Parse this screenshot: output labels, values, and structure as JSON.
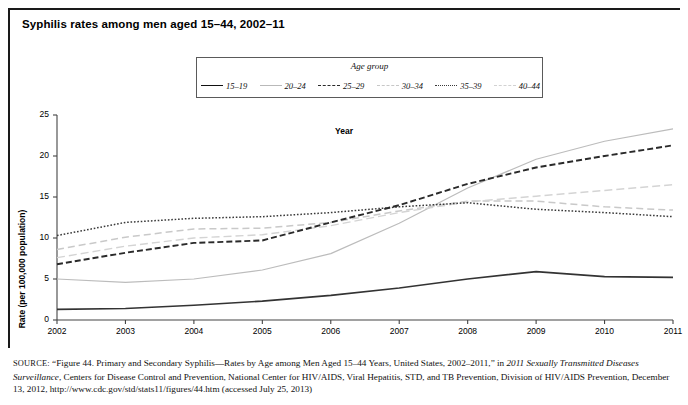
{
  "figure": {
    "title": "Syphilis rates among men aged 15–44, 2002–11"
  },
  "legend": {
    "title": "Age group",
    "items": [
      {
        "label": "15–19",
        "style": "solid-dark"
      },
      {
        "label": "20–24",
        "style": "solid-light"
      },
      {
        "label": "25–29",
        "style": "dash-dark"
      },
      {
        "label": "30–34",
        "style": "dash-light"
      },
      {
        "label": "35–39",
        "style": "dot-dark"
      },
      {
        "label": "40–44",
        "style": "dash-lighter"
      }
    ]
  },
  "axes": {
    "ylabel": "Rate (per 100,000 population)",
    "xlabel": "Year",
    "yticks": [
      "0",
      "5",
      "10",
      "15",
      "20",
      "25"
    ],
    "xticks": [
      "2002",
      "2003",
      "2004",
      "2005",
      "2006",
      "2007",
      "2008",
      "2009",
      "2010",
      "2011"
    ]
  },
  "source": {
    "label": "SOURCE:",
    "line1_a": " “Figure 44. Primary and Secondary Syphilis—Rates by Age among Men Aged 15–44 Years, United States, 2002–2011,” in ",
    "line1_em": "2011 Sexually Transmitted Diseases Surveillance",
    "line1_b": ", Centers for Disease Control and Prevention, National Center for HIV/AIDS, Viral Hepatitis, STD, and TB Prevention, Division of HIV/AIDS Prevention, December 13, 2012, http://www.cdc.gov/std/stats11/figures/44.htm (accessed July 25, 2013)"
  },
  "chart_data": {
    "type": "line",
    "title": "Syphilis rates among men aged 15–44, 2002–11",
    "xlabel": "Year",
    "ylabel": "Rate (per 100,000 population)",
    "legend_title": "Age group",
    "legend_position": "top-center",
    "grid": false,
    "x": [
      2002,
      2003,
      2004,
      2005,
      2006,
      2007,
      2008,
      2009,
      2010,
      2011
    ],
    "xlim": [
      2002,
      2011
    ],
    "ylim": [
      0,
      25
    ],
    "yticks": [
      0,
      5,
      10,
      15,
      20,
      25
    ],
    "series": [
      {
        "name": "15–19",
        "style": "solid-dark",
        "color": "#333333",
        "values": [
          1.3,
          1.4,
          1.8,
          2.3,
          3.0,
          3.9,
          5.0,
          5.9,
          5.3,
          5.2
        ]
      },
      {
        "name": "20–24",
        "style": "solid-light",
        "color": "#bcbcbc",
        "values": [
          5.0,
          4.6,
          5.0,
          6.1,
          8.1,
          11.8,
          16.1,
          19.6,
          21.8,
          23.3
        ]
      },
      {
        "name": "25–29",
        "style": "dash-dark",
        "color": "#2a2a2a",
        "values": [
          6.8,
          8.2,
          9.4,
          9.7,
          11.9,
          14.0,
          16.6,
          18.6,
          20.0,
          21.3
        ]
      },
      {
        "name": "30–34",
        "style": "dash-light",
        "color": "#c9c9c9",
        "values": [
          8.6,
          10.1,
          11.1,
          11.2,
          11.9,
          13.3,
          14.5,
          14.5,
          13.8,
          13.4
        ]
      },
      {
        "name": "35–39",
        "style": "dot-dark",
        "color": "#3a3a3a",
        "values": [
          10.3,
          11.9,
          12.4,
          12.6,
          13.1,
          13.8,
          14.3,
          13.5,
          13.1,
          12.6
        ]
      },
      {
        "name": "40–44",
        "style": "dash-lighter",
        "color": "#d4d4d4",
        "values": [
          7.6,
          9.0,
          10.0,
          10.4,
          11.5,
          13.1,
          14.4,
          15.1,
          15.8,
          16.5
        ]
      }
    ]
  }
}
